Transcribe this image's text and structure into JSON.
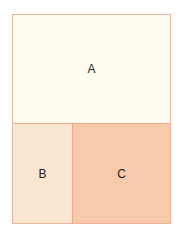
{
  "diagram": {
    "regions": [
      {
        "label": "A",
        "color": "#fffcf2"
      },
      {
        "label": "B",
        "color": "#fbe6d2"
      },
      {
        "label": "C",
        "color": "#f7caac"
      }
    ],
    "border_color": "#eeb39a"
  }
}
